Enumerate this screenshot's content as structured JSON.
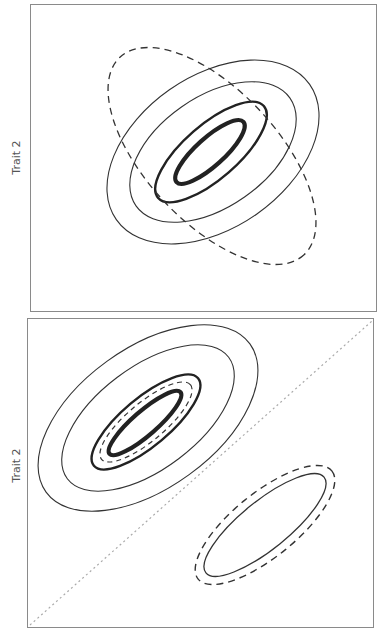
{
  "figure": {
    "panels": [
      {
        "id": "top",
        "ylabel": "Trait 2",
        "box": {
          "x": 30,
          "y": 4,
          "w": 347,
          "h": 308
        },
        "label_pos": {
          "x": 16,
          "y": 158
        },
        "diagonal": null,
        "ellipses": [
          {
            "name": "outer-thin-contour",
            "cx": 213,
            "cy": 152,
            "rx": 118,
            "ry": 76,
            "rot": -35,
            "stroke": "#333333",
            "width": 1.1,
            "dash": ""
          },
          {
            "name": "middle-thin-contour",
            "cx": 213,
            "cy": 152,
            "rx": 94,
            "ry": 55,
            "rot": -35,
            "stroke": "#333333",
            "width": 1.1,
            "dash": ""
          },
          {
            "name": "inner-medium-contour",
            "cx": 211,
            "cy": 152,
            "rx": 70,
            "ry": 27,
            "rot": -41,
            "stroke": "#222222",
            "width": 2.4,
            "dash": ""
          },
          {
            "name": "inner-thick-contour",
            "cx": 210,
            "cy": 152,
            "rx": 45,
            "ry": 14,
            "rot": -42,
            "stroke": "#222222",
            "width": 4.2,
            "dash": ""
          },
          {
            "name": "dashed-orthogonal-contour",
            "cx": 212,
            "cy": 156,
            "rx": 135,
            "ry": 66,
            "rot": 47,
            "stroke": "#333333",
            "width": 1.3,
            "dash": "7,5"
          }
        ]
      },
      {
        "id": "bottom",
        "ylabel": "Trait 2",
        "box": {
          "x": 27,
          "y": 318,
          "w": 347,
          "h": 310
        },
        "label_pos": {
          "x": 16,
          "y": 466
        },
        "diagonal": {
          "x1": 30,
          "y1": 625,
          "x2": 372,
          "y2": 321,
          "stroke": "#aaaaaa",
          "dash": "2,3"
        },
        "ellipses": [
          {
            "name": "outer-thin-contour",
            "cx": 148,
            "cy": 418,
            "rx": 126,
            "ry": 70,
            "rot": -36,
            "stroke": "#333333",
            "width": 1.1,
            "dash": ""
          },
          {
            "name": "middle-thin-contour",
            "cx": 148,
            "cy": 418,
            "rx": 101,
            "ry": 51,
            "rot": -37,
            "stroke": "#333333",
            "width": 1.1,
            "dash": ""
          },
          {
            "name": "inner-medium-contour",
            "cx": 146,
            "cy": 422,
            "rx": 68,
            "ry": 24,
            "rot": -40,
            "stroke": "#222222",
            "width": 2.4,
            "dash": ""
          },
          {
            "name": "inner-dashed-contour",
            "cx": 146,
            "cy": 422,
            "rx": 58,
            "ry": 19,
            "rot": -40,
            "stroke": "#333333",
            "width": 1.2,
            "dash": "5,4"
          },
          {
            "name": "inner-thick-contour",
            "cx": 145,
            "cy": 423,
            "rx": 47,
            "ry": 12,
            "rot": -41,
            "stroke": "#222222",
            "width": 4.2,
            "dash": ""
          },
          {
            "name": "offset-solid-contour",
            "cx": 265,
            "cy": 525,
            "rx": 76,
            "ry": 24,
            "rot": -39,
            "stroke": "#333333",
            "width": 1.3,
            "dash": ""
          },
          {
            "name": "offset-dashed-contour",
            "cx": 265,
            "cy": 525,
            "rx": 86,
            "ry": 32,
            "rot": -39,
            "stroke": "#333333",
            "width": 1.4,
            "dash": "7,5"
          }
        ]
      }
    ]
  }
}
